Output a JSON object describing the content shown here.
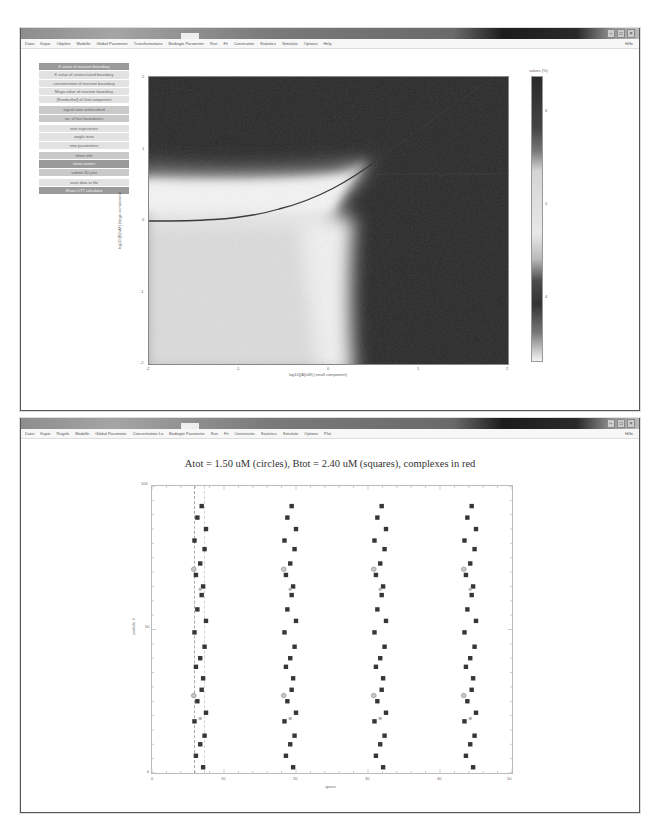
{
  "top_window": {
    "menu": [
      "Datei",
      "Kopie",
      "Objekte",
      "Modelle",
      "Global Parameter",
      "Transformations",
      "Bedingte Parameter",
      "Run",
      "Fit",
      "Constraints",
      "Statistics",
      "Simulate",
      "Options",
      "Help"
    ],
    "menu_right": "Hilfe",
    "buttons": [
      {
        "label": "K value of reaction boundary",
        "style": "dark"
      },
      {
        "label": "K value of unstructured boundary",
        "style": "light"
      },
      {
        "label": "concentration of reaction boundary",
        "style": "light"
      },
      {
        "label": "Mega value of reaction boundary",
        "style": "light"
      },
      {
        "label": "[Sundarthol] of 2nd component",
        "style": "light"
      },
      {
        "label": "signal ratio undisturbed",
        "style": "mid",
        "gap": true
      },
      {
        "label": "no. of fast boundaries",
        "style": "mid"
      },
      {
        "label": "new trajectories",
        "style": "light",
        "gap": true
      },
      {
        "label": "single tests",
        "style": "light"
      },
      {
        "label": "new parameters",
        "style": "light"
      },
      {
        "label": "show info",
        "style": "mid",
        "gap": true
      },
      {
        "label": "show names",
        "style": "dark"
      },
      {
        "label": "submit 3D plot",
        "style": "mid"
      },
      {
        "label": "save data to file",
        "style": "light",
        "gap": true
      },
      {
        "label": "Show LITT calculator",
        "style": "dark"
      }
    ],
    "chart": {
      "xlabel": "log10([A]/uM) (small component)",
      "ylabel": "log10([B]/uM) (large component)",
      "xticks": [
        "-2",
        "-1",
        "0",
        "1",
        "2"
      ],
      "yticks": [
        "2",
        "1",
        "0",
        "-1",
        "-2"
      ],
      "colorbar_label": "values (%)",
      "colorbar_ticks": [
        "6",
        "5",
        "4"
      ]
    }
  },
  "bottom_window": {
    "menu": [
      "Datei",
      "Kopie",
      "Regeln",
      "Modelle",
      "Global Parameter",
      "Concentration Ln",
      "Bedingte Parameter",
      "Run",
      "Fit",
      "Constraints",
      "Statistics",
      "Simulate",
      "Options",
      "Plot"
    ],
    "menu_right": "Hilfe",
    "title": "Atot = 1.50 uM (circles), Btot = 2.40 uM (squares), complexes in red"
  },
  "chart_data": [
    {
      "type": "heatmap",
      "title": "",
      "xlabel": "log10([A]/uM) (small component)",
      "ylabel": "log10([B]/uM) (large component)",
      "xlim": [
        -2,
        2
      ],
      "ylim": [
        -2,
        2
      ],
      "xticks": [
        -2,
        -1,
        0,
        1,
        2
      ],
      "yticks": [
        -2,
        -1,
        0,
        1,
        2
      ],
      "colorbar": {
        "label": "values (%)",
        "ticks": [
          4,
          5,
          6
        ]
      },
      "overlay_curve": {
        "description": "dark line from (-2, 0) rising to (2, 2)",
        "points": [
          [
            -2,
            0.0
          ],
          [
            -1.5,
            0.02
          ],
          [
            -1,
            0.08
          ],
          [
            -0.5,
            0.22
          ],
          [
            0,
            0.45
          ],
          [
            0.5,
            0.8
          ],
          [
            1,
            1.25
          ],
          [
            1.5,
            1.65
          ],
          [
            2,
            2.0
          ]
        ]
      },
      "regions": [
        {
          "area": "upper band y>0.8",
          "level": "dark"
        },
        {
          "area": "band y 0.2..0.7 left",
          "level": "light"
        },
        {
          "area": "lower-left x<-0.3, y<0",
          "level": "light"
        },
        {
          "area": "right x>0.2",
          "level": "dark"
        }
      ]
    },
    {
      "type": "scatter",
      "title": "Atot = 1.50 uM (circles), Btot = 2.40 uM (squares), complexes in red",
      "xlabel": "space",
      "ylabel": "particle #",
      "xlim": [
        0,
        50
      ],
      "ylim": [
        0,
        100
      ],
      "xticks": [
        0,
        10,
        20,
        30,
        40,
        50
      ],
      "yticks": [
        0,
        50,
        100
      ],
      "grid": false,
      "dashed_vlines": [
        6
      ],
      "columns_x": [
        6.5,
        19,
        31.5,
        44
      ],
      "series": [
        {
          "name": "squares (B)",
          "marker": "square",
          "columns_x": [
            6.5,
            19,
            31.5,
            44
          ],
          "y": [
            2,
            6,
            10,
            13,
            18,
            21,
            25,
            29,
            33,
            37,
            40,
            44,
            49,
            53,
            57,
            62,
            65,
            69,
            73,
            78,
            81,
            85,
            89,
            93
          ]
        },
        {
          "name": "circles (A)",
          "marker": "circle",
          "columns_x": [
            5.8,
            18.3,
            30.8,
            43.3
          ],
          "y": [
            27,
            71
          ]
        },
        {
          "name": "complexes",
          "marker": "circle",
          "color": "red",
          "y": [
            19,
            64
          ]
        }
      ]
    }
  ]
}
